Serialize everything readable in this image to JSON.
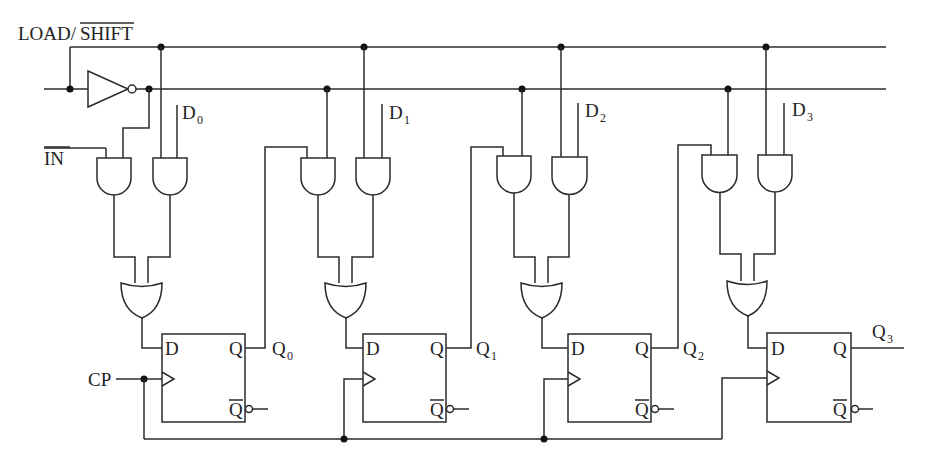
{
  "diagram": {
    "type": "4-bit parallel-load / shift register (D flip-flops)",
    "signals": {
      "load_shift_prefix": "LOAD/",
      "load_shift_bar": "SHIFT",
      "serial_in": "IN",
      "clock": "CP"
    },
    "data_inputs": [
      {
        "base": "D",
        "sub": "0"
      },
      {
        "base": "D",
        "sub": "1"
      },
      {
        "base": "D",
        "sub": "2"
      },
      {
        "base": "D",
        "sub": "3"
      }
    ],
    "outputs": [
      {
        "base": "Q",
        "sub": "0"
      },
      {
        "base": "Q",
        "sub": "1"
      },
      {
        "base": "Q",
        "sub": "2"
      },
      {
        "base": "Q",
        "sub": "3"
      }
    ],
    "flipflop_pins": {
      "d": "D",
      "q": "Q",
      "qbar": "Q"
    },
    "stage_count": 4
  }
}
